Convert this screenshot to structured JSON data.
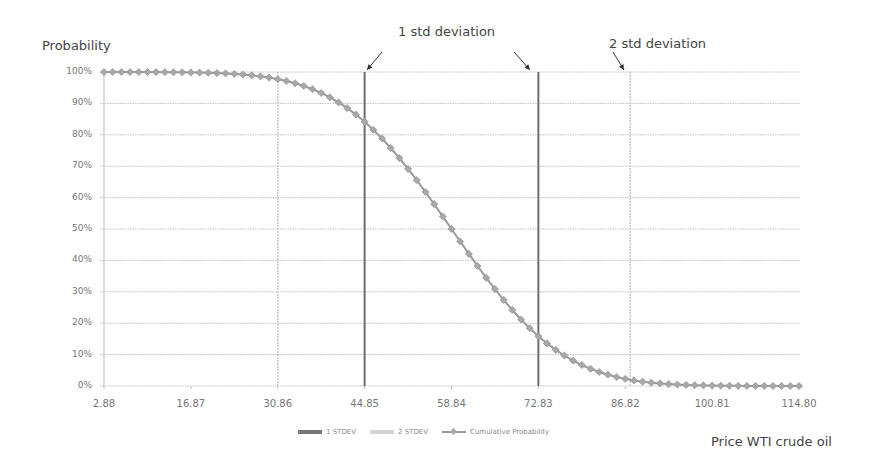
{
  "chart_data": {
    "type": "line",
    "title": "",
    "ylabel": "Probability",
    "xlabel": "Price WTI crude oil",
    "ylim": [
      0,
      1
    ],
    "xlim": [
      2.88,
      114.8
    ],
    "grid": true,
    "legend_position": "bottom",
    "y_ticks": [
      "100%",
      "90%",
      "80%",
      "70%",
      "60%",
      "50%",
      "40%",
      "30%",
      "20%",
      "10%",
      "0%"
    ],
    "x_ticks": [
      "2.88",
      "16.87",
      "30.86",
      "44.85",
      "58.84",
      "72.83",
      "86.82",
      "100.81",
      "114.80"
    ],
    "distribution": {
      "mean": 58.84,
      "std": 13.99,
      "kind": "complementary cumulative normal"
    },
    "series": [
      {
        "name": "Cumulative Probability",
        "x": [
          2.88,
          16.87,
          30.86,
          37.85,
          44.85,
          51.84,
          58.84,
          65.83,
          72.83,
          79.82,
          86.82,
          100.81,
          114.8
        ],
        "values": [
          1.0,
          1.0,
          0.98,
          0.93,
          0.84,
          0.69,
          0.5,
          0.31,
          0.16,
          0.07,
          0.02,
          0.0,
          0.0
        ]
      },
      {
        "name": "1 STDEV",
        "x_positions": [
          44.85,
          72.83
        ]
      },
      {
        "name": "2 STDEV",
        "x_positions": [
          30.86,
          86.82
        ]
      }
    ],
    "annotations": [
      "1 std deviation",
      "2 std deviation"
    ]
  },
  "labels": {
    "y_axis_title": "Probability",
    "x_axis_title": "Price WTI crude oil",
    "annot_1std": "1 std deviation",
    "annot_2std": "2 std deviation"
  },
  "legend": {
    "items": [
      {
        "label": "1 STDEV",
        "color": "#777777"
      },
      {
        "label": "2 STDEV",
        "color": "#cfcfcf"
      },
      {
        "label": "Cumulative Probability",
        "color": "#999999"
      }
    ]
  },
  "colors": {
    "curve": "#9a9a9a",
    "marker": "#a8a8a8",
    "stdev1": "#6e6e6e",
    "stdev2": "#c8c8c8",
    "grid": "#c0c0c0"
  }
}
